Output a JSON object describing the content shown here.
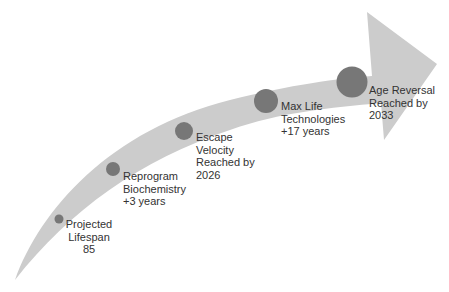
{
  "diagram": {
    "type": "curved-arrow-timeline",
    "colors": {
      "arrow_fill": "#cccccc",
      "circle_fill": "#777777",
      "text": "#333333",
      "background": "#ffffff"
    },
    "milestones": [
      {
        "lines": [
          "Projected",
          "Lifespan",
          "85"
        ]
      },
      {
        "lines": [
          "Reprogram",
          "Biochemistry",
          "+3 years"
        ]
      },
      {
        "lines": [
          "Escape",
          "Velocity",
          "Reached by",
          "2026"
        ]
      },
      {
        "lines": [
          "Max Life",
          "Technologies",
          "+17 years"
        ]
      },
      {
        "lines": [
          "Age Reversal",
          "Reached by",
          "2033"
        ]
      }
    ]
  }
}
